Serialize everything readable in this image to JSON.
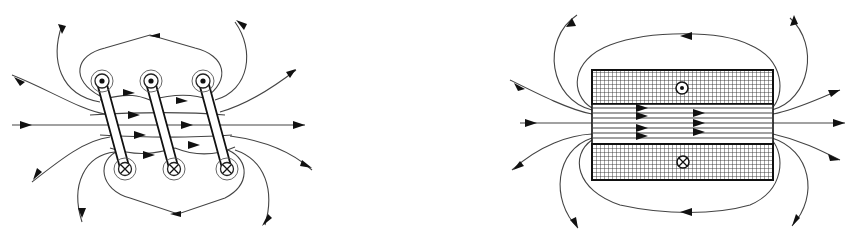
{
  "figure": {
    "panels": [
      {
        "id": "left",
        "subject": "solenoid-coil-perspective",
        "turns": 3,
        "top_symbols": [
          "current-out-dot",
          "current-out-dot",
          "current-out-dot"
        ],
        "bottom_symbols": [
          "current-in-cross",
          "current-in-cross",
          "current-in-cross"
        ],
        "field_direction": "left-to-right"
      },
      {
        "id": "right",
        "subject": "solenoid-cross-section",
        "top_symbol": "current-out-dot",
        "bottom_symbol": "current-in-cross",
        "field_direction": "left-to-right"
      }
    ],
    "colors": {
      "background": "#ffffff",
      "ink": "#111111",
      "field_line": "#444444"
    }
  }
}
